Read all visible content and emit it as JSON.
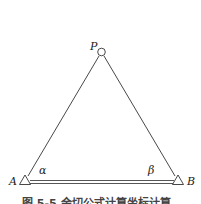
{
  "diagram": {
    "type": "triangulation / forward intersection",
    "points": {
      "P": {
        "label": "P",
        "symbol": "circle"
      },
      "A": {
        "label": "A",
        "symbol": "triangle"
      },
      "B": {
        "label": "B",
        "symbol": "triangle"
      }
    },
    "angles": {
      "alpha": {
        "label": "α",
        "at": "A"
      },
      "beta": {
        "label": "β",
        "at": "B"
      }
    },
    "baseline": {
      "from": "A",
      "to": "B",
      "style": "double-line"
    },
    "caption": "图 5-5  余切公式计算坐标计算"
  },
  "colors": {
    "line": "#333333",
    "background": "#ffffff"
  }
}
